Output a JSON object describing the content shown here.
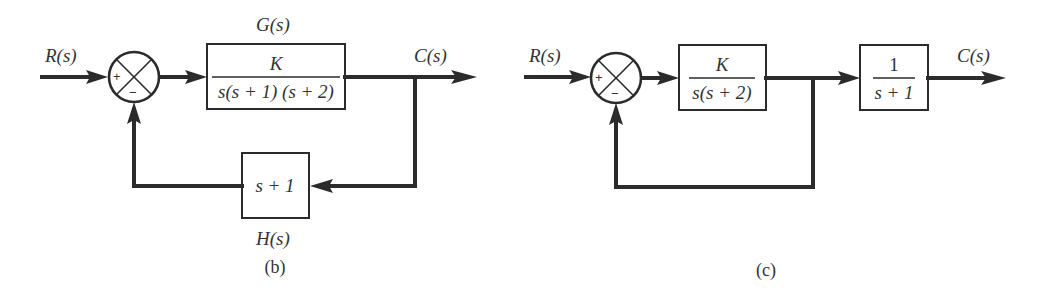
{
  "diagrams": [
    {
      "id": "b",
      "caption": "(b)",
      "input_label": "R(s)",
      "output_label": "C(s)",
      "summing_junction": {
        "plus_sign": "+",
        "minus_sign": "−"
      },
      "forward_block": {
        "name_label": "G(s)",
        "numerator": "K",
        "denominator": "s(s + 1) (s + 2)"
      },
      "feedback_block": {
        "name_label": "H(s)",
        "expression": "s + 1"
      }
    },
    {
      "id": "c",
      "caption": "(c)",
      "input_label": "R(s)",
      "output_label": "C(s)",
      "summing_junction": {
        "plus_sign": "+",
        "minus_sign": "−"
      },
      "forward_block": {
        "numerator": "K",
        "denominator": "s(s + 2)"
      },
      "output_block": {
        "numerator": "1",
        "denominator": "s + 1"
      },
      "feedback": "unity"
    }
  ],
  "colors": {
    "line": "#2b2b2b",
    "text": "#333333",
    "background": "#ffffff"
  }
}
